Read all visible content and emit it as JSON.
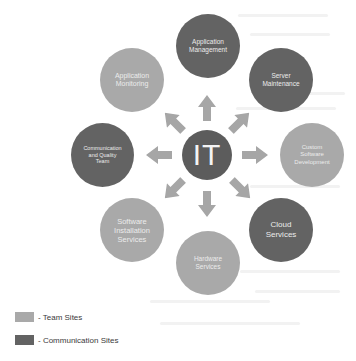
{
  "diagram": {
    "center": {
      "label": "IT",
      "color": "#5c5c5c"
    },
    "nodes": [
      {
        "id": "application-management",
        "label": "Application\nManagement",
        "type": "comm"
      },
      {
        "id": "server-maintenance",
        "label": "Server\nMaintenance",
        "type": "comm"
      },
      {
        "id": "custom-software-development",
        "label": "Custom\nSoftware\nDevelopment",
        "type": "team"
      },
      {
        "id": "cloud-services",
        "label": "Cloud\nServices",
        "type": "comm"
      },
      {
        "id": "hardware-services",
        "label": "Hardware\nServices",
        "type": "team"
      },
      {
        "id": "software-installation-services",
        "label": "Software\nInstallation\nServices",
        "type": "team"
      },
      {
        "id": "communication-and-quality-team",
        "label": "Communication\nand Quality\nTeam",
        "type": "comm"
      },
      {
        "id": "application-monitoring",
        "label": "Application\nMonitoring",
        "type": "team"
      }
    ],
    "arrow_color": "#a6a6a6"
  },
  "legend": {
    "items": [
      {
        "label": "- Team Sites",
        "color": "#a9a9a9"
      },
      {
        "label": "- Communication Sites",
        "color": "#636363"
      }
    ]
  },
  "colors": {
    "team": "#a9a9a9",
    "communication": "#636363",
    "center": "#5c5c5c",
    "arrow": "#a6a6a6"
  }
}
